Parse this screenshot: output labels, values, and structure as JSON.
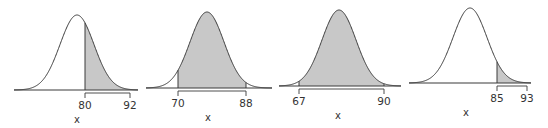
{
  "chart_data": [
    {
      "type": "area",
      "title": "",
      "xlabel": "x",
      "ylabel": "",
      "distribution": "normal",
      "shaded_region": "right tail",
      "shade_from": 80,
      "shade_to": null,
      "tick_labels": [
        "80",
        "92"
      ],
      "bracket": [
        80,
        92
      ],
      "grid": false
    },
    {
      "type": "area",
      "title": "",
      "xlabel": "x",
      "ylabel": "",
      "distribution": "normal",
      "shaded_region": "between",
      "shade_from": 70,
      "shade_to": 88,
      "tick_labels": [
        "70",
        "88"
      ],
      "bracket": [
        70,
        88
      ],
      "grid": false
    },
    {
      "type": "area",
      "title": "",
      "xlabel": "x",
      "ylabel": "",
      "distribution": "normal",
      "shaded_region": "between",
      "shade_from": 67,
      "shade_to": 90,
      "tick_labels": [
        "67",
        "90"
      ],
      "bracket": [
        67,
        90
      ],
      "grid": false
    },
    {
      "type": "area",
      "title": "",
      "xlabel": "x",
      "ylabel": "",
      "distribution": "normal",
      "shaded_region": "right tail",
      "shade_from": 85,
      "shade_to": null,
      "tick_labels": [
        "85",
        "93"
      ],
      "bracket": [
        85,
        93
      ],
      "grid": false
    }
  ],
  "colors": {
    "shade": "#c8c8c8",
    "line": "#3a3a3a",
    "text": "#333333"
  },
  "panels": [
    {
      "geom": {
        "x0": 14,
        "x1": 138,
        "mu": 77,
        "sigma": 17,
        "base": 90,
        "peak": 15,
        "shadeL": 85,
        "shadeR": 138,
        "brL": 85,
        "brR": 130,
        "xLabelX": 77
      },
      "labels": {
        "left": "80",
        "right": "92",
        "axis": "x"
      }
    },
    {
      "geom": {
        "x0": 146,
        "x1": 272,
        "mu": 207,
        "sigma": 17,
        "base": 88,
        "peak": 12,
        "shadeL": 178,
        "shadeR": 246,
        "brL": 178,
        "brR": 246,
        "xLabelX": 208
      },
      "labels": {
        "left": "70",
        "right": "88",
        "axis": "x"
      }
    },
    {
      "geom": {
        "x0": 279,
        "x1": 401,
        "mu": 339,
        "sigma": 17,
        "base": 86,
        "peak": 10,
        "shadeL": 299,
        "shadeR": 384,
        "brL": 299,
        "brR": 384,
        "xLabelX": 338
      },
      "labels": {
        "left": "67",
        "right": "90",
        "axis": "x"
      }
    },
    {
      "geom": {
        "x0": 409,
        "x1": 531,
        "mu": 470,
        "sigma": 17,
        "base": 83,
        "peak": 8,
        "shadeL": 497,
        "shadeR": 531,
        "brL": 497,
        "brR": 527,
        "xLabelX": 466
      },
      "labels": {
        "left": "85",
        "right": "93",
        "axis": "x"
      }
    }
  ]
}
